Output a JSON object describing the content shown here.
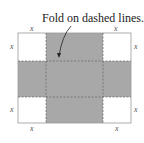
{
  "annotation": "Fold on dashed lines.",
  "corner_label": "x",
  "colors": {
    "shade": "#a6a6a6",
    "border": "#9a9a9a",
    "dash": "#666666"
  }
}
